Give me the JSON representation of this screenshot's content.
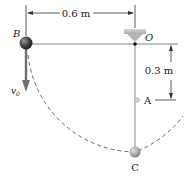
{
  "diagram": {
    "labels": {
      "B": "B",
      "O": "O",
      "A": "A",
      "C": "C",
      "v0": "v",
      "v0_sub": "0"
    },
    "dimensions": {
      "horizontal": "0.6 m",
      "vertical": "0.3 m"
    },
    "colors": {
      "line": "#333333",
      "rod": "#9a9a9a",
      "ball_dark": "#3c3c3c",
      "ball_light": "#a9a9a9",
      "support": "#bdbdbd",
      "arrow": "#707070"
    }
  }
}
